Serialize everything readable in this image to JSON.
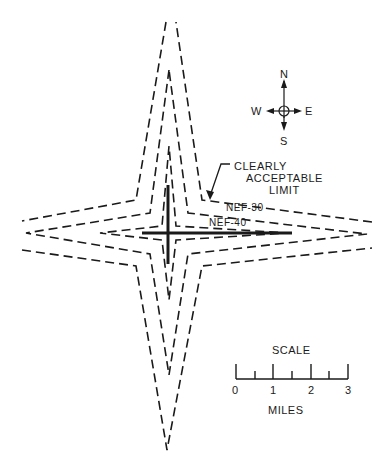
{
  "figure": {
    "contours": [
      {
        "id": "clearly-acceptable-limit",
        "label": "CLEARLY ACCEPTABLE LIMIT"
      },
      {
        "id": "nef-30",
        "label": "NEF-30"
      },
      {
        "id": "nef-40",
        "label": "NEF-40"
      }
    ],
    "callout": {
      "line1": "CLEARLY",
      "line2": "ACCEPTABLE",
      "line3": "LIMIT"
    },
    "nef30_label": "NEF-30",
    "nef40_label": "NEF-40",
    "compass": {
      "north": "N",
      "south": "S",
      "east": "E",
      "west": "W"
    },
    "scale": {
      "title": "SCALE",
      "ticks": [
        "0",
        "1",
        "2",
        "3"
      ],
      "unit": "MILES"
    },
    "colors": {
      "ink": "#1a1a1a",
      "background": "#ffffff"
    }
  }
}
